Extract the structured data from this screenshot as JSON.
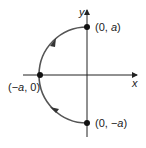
{
  "diagram": {
    "type": "parametric-curve",
    "axes": {
      "x_label": "x",
      "y_label": "y"
    },
    "points": [
      {
        "id": "top",
        "label_prefix": "(0, ",
        "label_var": "a",
        "label_suffix": ")"
      },
      {
        "id": "left",
        "label_prefix": "(−",
        "label_var": "a",
        "label_suffix": ", 0)"
      },
      {
        "id": "bottom",
        "label_prefix": "(0, −",
        "label_var": "a",
        "label_suffix": ")"
      }
    ],
    "direction": "counterclockwise-up (from bottom to top along left side)",
    "colors": {
      "axis": "#222222",
      "curve": "#555555",
      "point": "#111111"
    }
  }
}
